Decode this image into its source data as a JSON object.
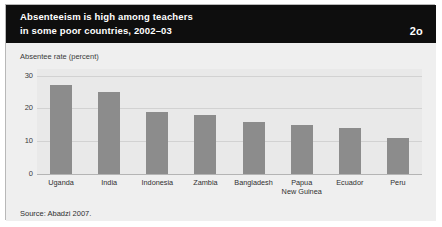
{
  "header": {
    "title_line1": "Absenteeism is high among teachers",
    "title_line2": "in some poor countries, 2002–03",
    "figure_number": "2o"
  },
  "footer": {
    "source": "Source: Abadzi 2007."
  },
  "colors": {
    "header_background": "#0e0e0e",
    "header_text": "#ffffff",
    "card_background": "#efefef",
    "plot_background": "#e9e9e9",
    "bar": "#8c8c8c",
    "gridline": "#d2d2d2",
    "baseline": "#b4b4b4"
  },
  "chart_data": {
    "type": "bar",
    "title": "Absenteeism is high among teachers in some poor countries, 2002–03",
    "subtitle": "",
    "xlabel": "",
    "ylabel": "Absentee rate (percent)",
    "categories": [
      "Uganda",
      "India",
      "Indonesia",
      "Zambia",
      "Bangladesh",
      "Papua New Guinea",
      "Ecuador",
      "Peru"
    ],
    "category_lines": [
      [
        "Uganda"
      ],
      [
        "India"
      ],
      [
        "Indonesia"
      ],
      [
        "Zambia"
      ],
      [
        "Bangladesh"
      ],
      [
        "Papua",
        "New Guinea"
      ],
      [
        "Ecuador"
      ],
      [
        "Peru"
      ]
    ],
    "values": [
      27,
      25,
      19,
      18,
      16,
      15,
      14,
      11
    ],
    "ylim": [
      0,
      32
    ],
    "yticks": [
      0,
      10,
      20,
      30
    ],
    "ytick_labels": [
      "0",
      "10",
      "20",
      "30"
    ],
    "grid": true,
    "legend": false,
    "source": "Source: Abadzi 2007."
  }
}
